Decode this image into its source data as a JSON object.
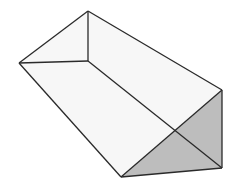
{
  "diagram": {
    "title": "",
    "type": "triangular-prism-3d",
    "colors": {
      "background": "#ffffff",
      "edge": "#2a2a2a",
      "hidden_edge": "#555555",
      "light_face": "#f7f7f7",
      "shaded_face": "#bdbdbd"
    },
    "vertices": {
      "top": [
        88,
        11
      ],
      "left": [
        19,
        63
      ],
      "inner": [
        88,
        61
      ],
      "right_top": [
        222,
        90
      ],
      "right_bottom": [
        222,
        168
      ],
      "bottom": [
        121,
        177
      ]
    }
  }
}
